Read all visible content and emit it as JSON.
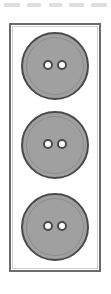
{
  "figure": {
    "background_color": "#ffffff",
    "card": {
      "name": "button card",
      "border_color": "#6b6b6b",
      "fill_color": "#ffffff",
      "shape": "rectangle"
    },
    "button_color": "#a0a0a0",
    "button_outline_color": "#4a4a4a",
    "hole_color": "#ffffff",
    "hole_outline_color": "#4a4a4a",
    "buttons": [
      {
        "label": "button 1",
        "holes": 2,
        "position": "top"
      },
      {
        "label": "button 2",
        "holes": 2,
        "position": "middle"
      },
      {
        "label": "button 3",
        "holes": 2,
        "position": "bottom"
      }
    ],
    "top_artifacts": [
      {
        "label": "cut-off mark 1"
      },
      {
        "label": "cut-off mark 2"
      },
      {
        "label": "cut-off mark 3"
      },
      {
        "label": "cut-off mark 4"
      },
      {
        "label": "cut-off mark 5"
      }
    ]
  }
}
